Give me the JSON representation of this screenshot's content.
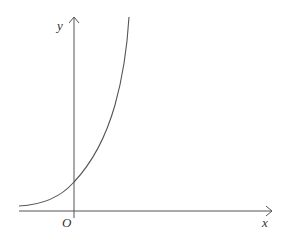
{
  "diagram": {
    "type": "function-graph",
    "labels": {
      "y_axis": "y",
      "x_axis": "x",
      "origin": "O"
    },
    "colors": {
      "axis": "#555555",
      "curve": "#555555",
      "text": "#333333"
    }
  }
}
